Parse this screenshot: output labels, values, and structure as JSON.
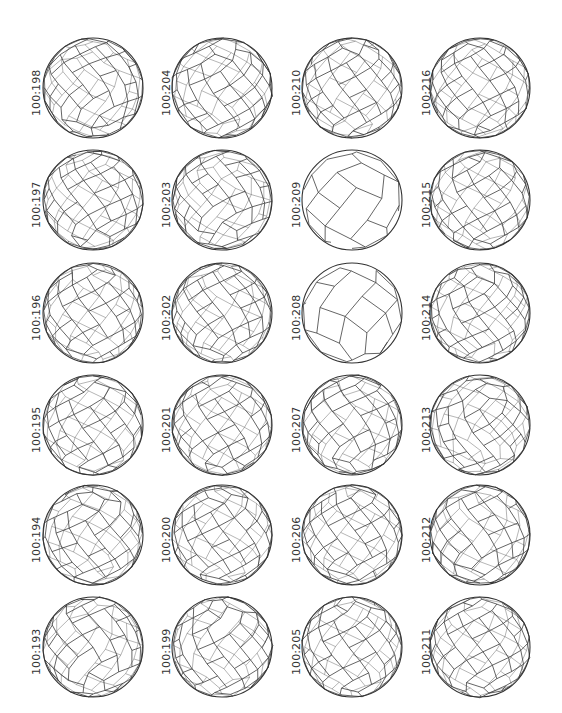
{
  "figure": {
    "layout": {
      "columns": 4,
      "rows": 6
    },
    "style": {
      "line_color": "#333333",
      "background": "#ffffff"
    },
    "columns": [
      {
        "cells": [
          {
            "label": "100:198",
            "shape": "round",
            "seed": 198
          },
          {
            "label": "100:197",
            "shape": "round",
            "seed": 197
          },
          {
            "label": "100:196",
            "shape": "round",
            "seed": 196
          },
          {
            "label": "100:195",
            "shape": "round",
            "seed": 195
          },
          {
            "label": "100:194",
            "shape": "round",
            "seed": 194
          },
          {
            "label": "100:193",
            "shape": "round",
            "seed": 193
          }
        ]
      },
      {
        "cells": [
          {
            "label": "100:204",
            "shape": "round",
            "seed": 204
          },
          {
            "label": "100:203",
            "shape": "round",
            "seed": 203
          },
          {
            "label": "100:202",
            "shape": "round",
            "seed": 202
          },
          {
            "label": "100:201",
            "shape": "round",
            "seed": 201
          },
          {
            "label": "100:200",
            "shape": "round",
            "seed": 200
          },
          {
            "label": "100:199",
            "shape": "round",
            "seed": 199
          }
        ]
      },
      {
        "cells": [
          {
            "label": "100:210",
            "shape": "round",
            "seed": 210
          },
          {
            "label": "100:209",
            "shape": "coarse",
            "seed": 209
          },
          {
            "label": "100:208",
            "shape": "coarse",
            "seed": 208
          },
          {
            "label": "100:207",
            "shape": "round",
            "seed": 207
          },
          {
            "label": "100:206",
            "shape": "round",
            "seed": 206
          },
          {
            "label": "100:205",
            "shape": "round",
            "seed": 205
          }
        ]
      },
      {
        "cells": [
          {
            "label": "100:216",
            "shape": "round",
            "seed": 216
          },
          {
            "label": "100:215",
            "shape": "round",
            "seed": 215
          },
          {
            "label": "100:214",
            "shape": "round",
            "seed": 214
          },
          {
            "label": "100:213",
            "shape": "round",
            "seed": 213
          },
          {
            "label": "100:212",
            "shape": "round",
            "seed": 212
          },
          {
            "label": "100:211",
            "shape": "round",
            "seed": 211
          }
        ]
      }
    ]
  }
}
